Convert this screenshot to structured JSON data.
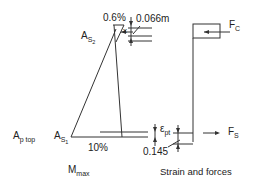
{
  "diagram": {
    "labels": {
      "top_strain": "0.6%",
      "top_depth": "0.066m",
      "neutral_axis": "x",
      "As2_main": "A",
      "As2_sub": "S",
      "As2_subsub": "2",
      "As1_main": "A",
      "As1_sub": "S",
      "As1_subsub": "1",
      "Ap_main": "A",
      "Ap_sub": "p top",
      "bottom_strain": "10%",
      "eps_main": "ε",
      "eps_sub": "pt",
      "lever_arm": "0.145",
      "moment_main": "M",
      "moment_sub": "max",
      "Fc_main": "F",
      "Fc_sub": "C",
      "Fs_main": "F",
      "Fs_sub": "S",
      "caption": "Strain and forces"
    },
    "colors": {
      "line": "#333333",
      "text": "#222222",
      "background": "#ffffff"
    }
  }
}
